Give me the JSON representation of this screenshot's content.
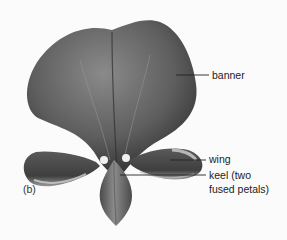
{
  "figure": {
    "panel_label": "(b)",
    "labels": {
      "banner": "banner",
      "wing": "wing",
      "keel_line1": "keel (two",
      "keel_line2": "fused petals)"
    },
    "colors": {
      "petal_dark": "#3a3a3a",
      "petal_mid": "#6e6e6e",
      "petal_light": "#b5b5b5",
      "leader_line": "#222222",
      "background": "#fbfbfb"
    }
  }
}
